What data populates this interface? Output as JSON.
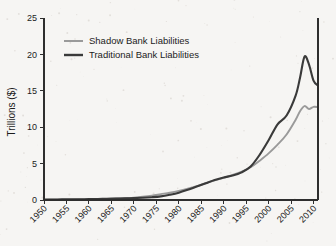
{
  "figure": {
    "background_color": "#f6f5f3",
    "axis_color": "#2e2e2e"
  },
  "axes": {
    "ylabel": "Trillions ($)",
    "xlabel": "",
    "y_ticks": [
      "0",
      "5",
      "10",
      "15",
      "20",
      "25"
    ],
    "x_ticks": [
      "1950",
      "1955",
      "1960",
      "1965",
      "1970",
      "1975",
      "1980",
      "1985",
      "1990",
      "1995",
      "2000",
      "2005",
      "2010"
    ]
  },
  "legend": {
    "position": "upper-left-inside",
    "entries": [
      {
        "label": "Shadow Bank Liabilities",
        "color": "#9a9a9a"
      },
      {
        "label": "Traditional Bank Liabilities",
        "color": "#3a3a3a"
      }
    ]
  },
  "chart_data": {
    "type": "line",
    "title": "",
    "xlabel": "",
    "ylabel": "Trillions ($)",
    "xlim": [
      1950,
      2011
    ],
    "ylim": [
      0,
      25
    ],
    "grid": false,
    "legend_position": "upper-left-inside",
    "x": [
      1950,
      1952,
      1954,
      1956,
      1958,
      1960,
      1962,
      1964,
      1966,
      1968,
      1970,
      1972,
      1974,
      1976,
      1978,
      1980,
      1982,
      1984,
      1986,
      1988,
      1990,
      1992,
      1994,
      1996,
      1998,
      2000,
      2002,
      2004,
      2006,
      2007,
      2008,
      2009,
      2010,
      2011
    ],
    "series": [
      {
        "name": "Shadow Bank Liabilities",
        "color": "#9a9a9a",
        "values": [
          0.02,
          0.03,
          0.04,
          0.05,
          0.07,
          0.09,
          0.12,
          0.16,
          0.2,
          0.26,
          0.33,
          0.45,
          0.6,
          0.8,
          1.0,
          1.25,
          1.55,
          1.9,
          2.3,
          2.7,
          3.05,
          3.45,
          3.9,
          4.5,
          5.4,
          6.4,
          7.6,
          9.0,
          11.0,
          12.2,
          12.9,
          12.5,
          12.8,
          12.75
        ]
      },
      {
        "name": "Traditional Bank Liabilities",
        "color": "#3a3a3a",
        "values": [
          0.06,
          0.07,
          0.08,
          0.09,
          0.1,
          0.12,
          0.14,
          0.16,
          0.19,
          0.22,
          0.26,
          0.3,
          0.38,
          0.5,
          0.72,
          1.0,
          1.4,
          1.85,
          2.3,
          2.75,
          3.1,
          3.35,
          3.8,
          4.6,
          6.2,
          8.2,
          10.4,
          11.6,
          14.3,
          16.8,
          19.7,
          18.6,
          16.4,
          15.7
        ]
      }
    ],
    "annotations": [
      {
        "text": "Series cross near 1994 at about 3.9 trillion",
        "x": 1994,
        "y": 3.9
      },
      {
        "text": "Traditional Bank Liabilities peak about 19.7 trillion in 2008",
        "x": 2008,
        "y": 19.7
      },
      {
        "text": "Shadow Bank Liabilities peak about 12.9 trillion in 2008",
        "x": 2008,
        "y": 12.9
      }
    ]
  }
}
